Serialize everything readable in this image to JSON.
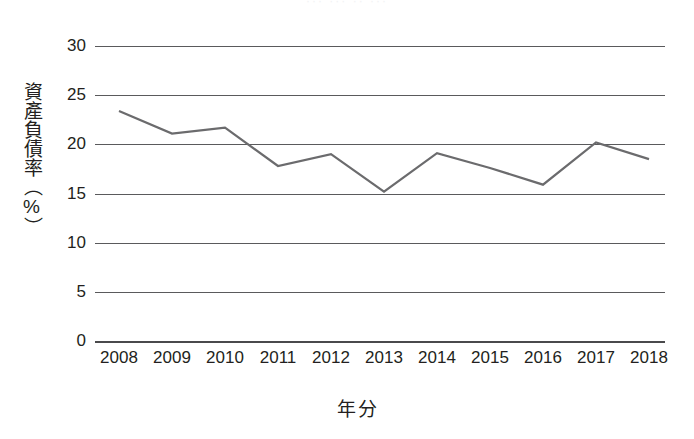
{
  "top_cut_text": "··· ··· ·· ···",
  "chart_data": {
    "type": "line",
    "title": "",
    "xlabel": "年分",
    "ylabel": "資產負債率（%）",
    "categories": [
      "2008",
      "2009",
      "2010",
      "2011",
      "2012",
      "2013",
      "2014",
      "2015",
      "2016",
      "2017",
      "2018"
    ],
    "values": [
      23.4,
      21.1,
      21.7,
      17.8,
      19.0,
      15.2,
      19.1,
      17.6,
      15.9,
      20.2,
      18.5
    ],
    "series": [
      {
        "name": "資產負債率",
        "values": [
          23.4,
          21.1,
          21.7,
          17.8,
          19.0,
          15.2,
          19.1,
          17.6,
          15.9,
          20.2,
          18.5
        ]
      }
    ],
    "ylim": [
      0,
      30
    ],
    "yticks": [
      0,
      5,
      10,
      15,
      20,
      25,
      30
    ],
    "ytick_labels": [
      "0",
      "5",
      "10",
      "15",
      "20",
      "25",
      "30"
    ],
    "grid": true,
    "legend": "none",
    "line_color": "#6b6b6d",
    "grid_color": "#5a5a5c",
    "text_color": "#231f20",
    "background": "#ffffff",
    "markers": false,
    "line_width": 2
  }
}
